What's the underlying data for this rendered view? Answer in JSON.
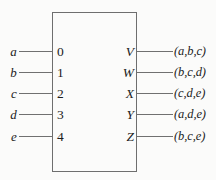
{
  "diagram": {
    "type": "block-diagram",
    "title": "",
    "background_color": "#fbfbfa",
    "line_color": "#707070",
    "text_color": "#1c1c1c",
    "block": {
      "label": "",
      "x": 52,
      "y": 12,
      "width": 85,
      "height": 160
    },
    "rows": [
      {
        "input_label": "a",
        "input_pin": "0",
        "output_pin": "V",
        "output_label": "(a,b,c)"
      },
      {
        "input_label": "b",
        "input_pin": "1",
        "output_pin": "W",
        "output_label": "(b,c,d)"
      },
      {
        "input_label": "c",
        "input_pin": "2",
        "output_pin": "X",
        "output_label": "(c,d,e)"
      },
      {
        "input_label": "d",
        "input_pin": "3",
        "output_pin": "Y",
        "output_label": "(a,d,e)"
      },
      {
        "input_label": "e",
        "input_pin": "4",
        "output_pin": "Z",
        "output_label": "(b,c,e)"
      }
    ]
  }
}
